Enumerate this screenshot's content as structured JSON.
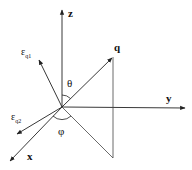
{
  "diagram": {
    "origin": [
      62,
      107
    ],
    "axes": {
      "z": {
        "label": "z",
        "end": [
          62,
          9
        ]
      },
      "y": {
        "label": "y",
        "end": [
          186,
          108
        ]
      },
      "x": {
        "label": "x",
        "end": [
          9,
          162
        ]
      }
    },
    "vectors": {
      "q": {
        "label": "q",
        "end": [
          113,
          57
        ]
      },
      "eps_q1": {
        "label_main": "ε",
        "label_sub": "q1",
        "end": [
          38,
          59
        ]
      },
      "eps_q2": {
        "label_main": "ε",
        "label_sub": "q2",
        "end": [
          16,
          135
        ]
      }
    },
    "construction_lines": {
      "q_drop": {
        "from": [
          113,
          57
        ],
        "to": [
          113,
          158
        ]
      },
      "q_projection": {
        "from": [
          62,
          107
        ],
        "to": [
          113,
          158
        ]
      }
    },
    "angles": {
      "theta": {
        "label": "θ",
        "between": [
          "z",
          "q"
        ]
      },
      "phi": {
        "label": "φ",
        "between": [
          "x",
          "q_projection"
        ]
      }
    },
    "colors": {
      "line": "#222222",
      "background": "#ffffff"
    }
  }
}
